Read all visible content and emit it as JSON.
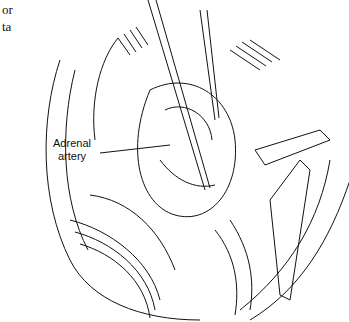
{
  "figure": {
    "clipped_text_lines": [
      "or",
      "ta"
    ],
    "label": {
      "line1": "Adrenal",
      "line2": "artery"
    }
  }
}
